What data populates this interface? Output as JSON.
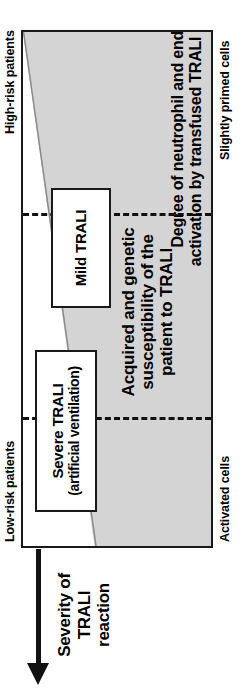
{
  "figure": {
    "axis_labels": {
      "low_risk": "Low-risk patients",
      "high_risk": "High-risk patients",
      "activated": "Activated cells",
      "slightly_primed": "Slightly primed cells"
    },
    "severity_axis": {
      "caption_line1": "Severity of",
      "caption_line2": "TRALI",
      "caption_line3": "reaction",
      "arrow_direction": "left"
    },
    "callouts": [
      {
        "name": "severe",
        "line1": "Severe TRALI",
        "line2": "(artificial ventilation)"
      },
      {
        "name": "mild",
        "line1": "Mild TRALI",
        "line2": ""
      }
    ],
    "gradient_axes": {
      "top_axis_line1": "Acquired and genetic",
      "top_axis_line2": "susceptibility of the",
      "top_axis_line3": "patient to TRALI",
      "bottom_axis_line1": "Degree of neutrophil and endothelial",
      "bottom_axis_line2": "activation by transfused TRALI mediators"
    },
    "colors": {
      "wedge_fill": "#d4d4d4",
      "frame": "#1a1a1a",
      "text": "#000000",
      "background": "#ffffff"
    }
  }
}
